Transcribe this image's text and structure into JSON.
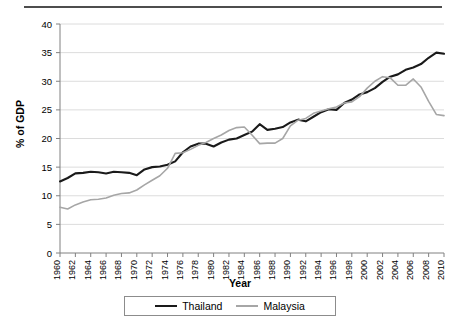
{
  "chart_data": {
    "type": "line",
    "title": "",
    "xlabel": "Year",
    "ylabel": "% of GDP",
    "xlim": [
      1960,
      2010
    ],
    "ylim": [
      0,
      40
    ],
    "yticks": [
      0,
      5,
      10,
      15,
      20,
      25,
      30,
      35,
      40
    ],
    "xticks": [
      1960,
      1962,
      1964,
      1966,
      1968,
      1970,
      1972,
      1974,
      1976,
      1978,
      1980,
      1982,
      1984,
      1986,
      1988,
      1990,
      1992,
      1994,
      1996,
      1998,
      2000,
      2002,
      2004,
      2006,
      2008,
      2010
    ],
    "grid": true,
    "grid_axis": "y",
    "legend_position": "bottom",
    "x": [
      1960,
      1961,
      1962,
      1963,
      1964,
      1965,
      1966,
      1967,
      1968,
      1969,
      1970,
      1971,
      1972,
      1973,
      1974,
      1975,
      1976,
      1977,
      1978,
      1979,
      1980,
      1981,
      1982,
      1983,
      1984,
      1985,
      1986,
      1987,
      1988,
      1989,
      1990,
      1991,
      1992,
      1993,
      1994,
      1995,
      1996,
      1997,
      1998,
      1999,
      2000,
      2001,
      2002,
      2003,
      2004,
      2005,
      2006,
      2007,
      2008,
      2009,
      2010
    ],
    "series": [
      {
        "name": "Thailand",
        "color": "#1a1a1a",
        "values": [
          12.5,
          13.1,
          13.9,
          14.0,
          14.2,
          14.1,
          13.9,
          14.2,
          14.1,
          14.0,
          13.6,
          14.6,
          15.0,
          15.1,
          15.4,
          16.0,
          17.6,
          18.6,
          19.1,
          19.1,
          18.6,
          19.3,
          19.8,
          20.0,
          20.6,
          21.2,
          22.5,
          21.5,
          21.7,
          22.0,
          22.8,
          23.3,
          23.0,
          23.8,
          24.6,
          25.1,
          25.0,
          26.2,
          26.8,
          27.7,
          28.1,
          28.8,
          29.9,
          30.8,
          31.2,
          32.0,
          32.4,
          33.0,
          34.1,
          35.0,
          34.8
        ]
      },
      {
        "name": "Malaysia",
        "color": "#a6a6a6",
        "values": [
          8.0,
          7.7,
          8.4,
          8.9,
          9.3,
          9.4,
          9.6,
          10.1,
          10.4,
          10.5,
          11.0,
          11.9,
          12.7,
          13.5,
          14.8,
          17.4,
          17.5,
          18.1,
          18.8,
          19.3,
          20.0,
          20.6,
          21.4,
          21.9,
          22.0,
          20.6,
          19.1,
          19.2,
          19.2,
          20.0,
          22.2,
          23.2,
          23.5,
          24.4,
          24.8,
          25.2,
          25.5,
          26.2,
          26.4,
          27.3,
          28.8,
          30.0,
          30.8,
          30.6,
          29.3,
          29.3,
          30.4,
          29.0,
          26.5,
          24.2,
          24.0
        ]
      }
    ]
  },
  "legend": {
    "items": [
      {
        "label": "Thailand",
        "color": "#1a1a1a"
      },
      {
        "label": "Malaysia",
        "color": "#a6a6a6"
      }
    ]
  },
  "axes": {
    "x_title": "Year",
    "y_title": "% of GDP"
  }
}
